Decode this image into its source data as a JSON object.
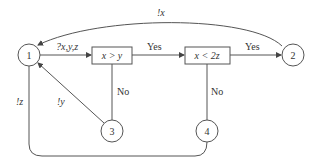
{
  "diagram": {
    "type": "flowchart",
    "nodes": {
      "n1": {
        "label": "1"
      },
      "n2": {
        "label": "2"
      },
      "n3": {
        "label": "3"
      },
      "n4": {
        "label": "4"
      },
      "cond1": {
        "label": "x > y"
      },
      "cond2": {
        "label": "x < 2z"
      }
    },
    "edges": {
      "n1_to_cond1": "?x,y,z",
      "cond1_yes": "Yes",
      "cond2_yes": "Yes",
      "cond1_no": "No",
      "cond2_no": "No",
      "n2_to_n1": "!x",
      "n3_to_n1": "!y",
      "n4_to_n1": "!z"
    },
    "colors": {
      "stroke": "#555555",
      "text": "#333333",
      "background": "#ffffff"
    }
  }
}
